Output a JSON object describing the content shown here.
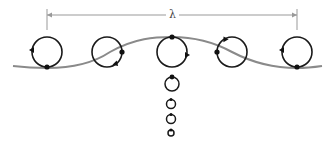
{
  "wavelength": {
    "label": "λ",
    "x_start": 47,
    "x_end": 297,
    "y": 15,
    "tick_bottom": 30,
    "label_x": 166,
    "label_y": 9
  },
  "colors": {
    "wave": "#8a8a8a",
    "orbit": "#1a1a1a",
    "dimension": "#999999",
    "particle": "#111111"
  },
  "wave_path": "M 13 66 C 30 68, 40 68, 47 68 C 75 68, 95 62, 110 52 C 135 38, 155 37, 172 37 C 190 37, 210 40, 232 52 C 255 64, 275 68, 297 68 C 305 68, 315 67, 322 66",
  "orbits": [
    {
      "id": "orbit-trough-left",
      "cx": 47,
      "cy": 52,
      "r": 15,
      "dot": [
        47,
        67
      ],
      "arrow": [
        32,
        50
      ],
      "arrow_rot": -90
    },
    {
      "id": "orbit-rising",
      "cx": 107,
      "cy": 52,
      "r": 15,
      "dot": [
        122,
        52
      ],
      "arrow": [
        116,
        64
      ],
      "arrow_rot": 135
    },
    {
      "id": "orbit-crest",
      "cx": 172,
      "cy": 52,
      "r": 15,
      "dot": [
        172,
        37
      ],
      "arrow": [
        187,
        55
      ],
      "arrow_rot": 90
    },
    {
      "id": "orbit-falling",
      "cx": 232,
      "cy": 52,
      "r": 15,
      "dot": [
        217,
        52
      ],
      "arrow": [
        225,
        39
      ],
      "arrow_rot": -30
    },
    {
      "id": "orbit-trough-right",
      "cx": 297,
      "cy": 52,
      "r": 15,
      "dot": [
        297,
        67
      ],
      "arrow": [
        282,
        50
      ],
      "arrow_rot": -90
    }
  ],
  "depth_orbits": [
    {
      "id": "depth-orbit-1",
      "cx": 172,
      "cy": 84,
      "r": 7,
      "dot": [
        172,
        77
      ]
    },
    {
      "id": "depth-orbit-2",
      "cx": 171,
      "cy": 104,
      "r": 4.5,
      "dot": [
        171,
        99.5
      ]
    },
    {
      "id": "depth-orbit-3",
      "cx": 171,
      "cy": 119,
      "r": 4.5,
      "dot": [
        171,
        114.5
      ]
    },
    {
      "id": "depth-orbit-4",
      "cx": 171,
      "cy": 133,
      "r": 3,
      "dot": [
        171,
        130
      ]
    }
  ]
}
